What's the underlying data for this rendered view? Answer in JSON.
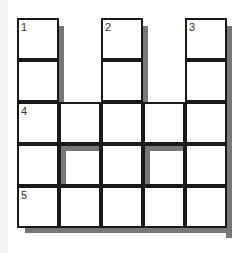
{
  "puzzle": {
    "rows": 5,
    "cols": 5,
    "clue_numbers": [
      "1",
      "2",
      "3",
      "4",
      "5"
    ],
    "cells": [
      {
        "r": 0,
        "c": 0,
        "num": "1"
      },
      {
        "r": 0,
        "c": 2,
        "num": "2"
      },
      {
        "r": 0,
        "c": 4,
        "num": "3"
      },
      {
        "r": 1,
        "c": 0
      },
      {
        "r": 1,
        "c": 2
      },
      {
        "r": 1,
        "c": 4
      },
      {
        "r": 2,
        "c": 0,
        "num": "4"
      },
      {
        "r": 2,
        "c": 1
      },
      {
        "r": 2,
        "c": 2
      },
      {
        "r": 2,
        "c": 3
      },
      {
        "r": 2,
        "c": 4
      },
      {
        "r": 3,
        "c": 0
      },
      {
        "r": 3,
        "c": 1
      },
      {
        "r": 3,
        "c": 2
      },
      {
        "r": 3,
        "c": 3
      },
      {
        "r": 3,
        "c": 4
      },
      {
        "r": 4,
        "c": 0,
        "num": "5"
      },
      {
        "r": 4,
        "c": 1
      },
      {
        "r": 4,
        "c": 2
      },
      {
        "r": 4,
        "c": 3
      },
      {
        "r": 4,
        "c": 4
      }
    ]
  },
  "colors": {
    "border": "#1a1a1a",
    "shadow": "#777777",
    "cell": "#ffffff"
  }
}
